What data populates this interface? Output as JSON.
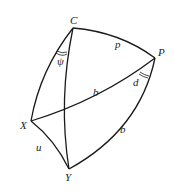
{
  "diagram": {
    "title": "",
    "type": "spherical-triangle-figure",
    "points": [
      {
        "id": "C",
        "label": "C",
        "x": 73,
        "y": 28
      },
      {
        "id": "P",
        "label": "P",
        "x": 155,
        "y": 58
      },
      {
        "id": "X",
        "label": "X",
        "x": 31,
        "y": 121
      },
      {
        "id": "Y",
        "label": "Y",
        "x": 69,
        "y": 169
      }
    ],
    "arcs": [
      {
        "from": "C",
        "to": "P",
        "label": "p"
      },
      {
        "from": "P",
        "to": "X",
        "label": "b"
      },
      {
        "from": "P",
        "to": "Y",
        "label": "b"
      },
      {
        "from": "C",
        "to": "X",
        "label": ""
      },
      {
        "from": "C",
        "to": "Y",
        "label": ""
      },
      {
        "from": "X",
        "to": "Y",
        "label": "u"
      }
    ],
    "angles": [
      {
        "at": "C",
        "label": "ψ"
      },
      {
        "at": "P",
        "label": "d"
      }
    ],
    "labels": {
      "C": "C",
      "P": "P",
      "X": "X",
      "Y": "Y",
      "p": "p",
      "b_upper": "b",
      "b_lower": "b",
      "d": "d",
      "psi": "ψ",
      "u": "u"
    }
  }
}
